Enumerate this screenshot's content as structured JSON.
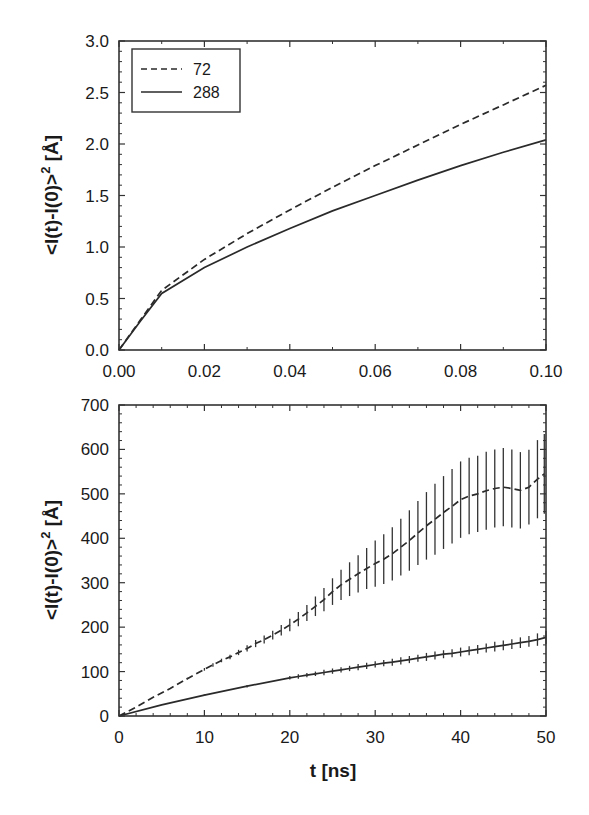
{
  "chart_data": [
    {
      "type": "line",
      "panel": "top",
      "title": "",
      "xlabel": "",
      "ylabel": "<l(t)-l(0)>² [Å]",
      "xlim": [
        0.0,
        0.1
      ],
      "ylim": [
        0.0,
        3.0
      ],
      "xticks": [
        "0.00",
        "0.02",
        "0.04",
        "0.06",
        "0.08",
        "0.10"
      ],
      "yticks": [
        "0.0",
        "0.5",
        "1.0",
        "1.5",
        "2.0",
        "2.5",
        "3.0"
      ],
      "grid": false,
      "legend_position": "upper-left",
      "series": [
        {
          "name": "72",
          "style": "dashed",
          "x": [
            0.0,
            0.005,
            0.01,
            0.02,
            0.03,
            0.04,
            0.05,
            0.06,
            0.07,
            0.08,
            0.09,
            0.1
          ],
          "y": [
            0.0,
            0.29,
            0.58,
            0.88,
            1.13,
            1.36,
            1.58,
            1.79,
            1.99,
            2.19,
            2.38,
            2.57
          ]
        },
        {
          "name": "288",
          "style": "solid",
          "x": [
            0.0,
            0.005,
            0.01,
            0.02,
            0.03,
            0.04,
            0.05,
            0.06,
            0.07,
            0.08,
            0.09,
            0.1
          ],
          "y": [
            0.0,
            0.28,
            0.55,
            0.8,
            1.0,
            1.18,
            1.35,
            1.5,
            1.65,
            1.79,
            1.92,
            2.04
          ]
        }
      ]
    },
    {
      "type": "line",
      "panel": "bottom",
      "title": "",
      "xlabel": "t [ns]",
      "ylabel": "<l(t)-l(0)>² [Å]",
      "xlim": [
        0,
        50
      ],
      "ylim": [
        0,
        700
      ],
      "xticks": [
        "0",
        "10",
        "20",
        "30",
        "40",
        "50"
      ],
      "yticks": [
        "0",
        "100",
        "200",
        "300",
        "400",
        "500",
        "600",
        "700"
      ],
      "grid": false,
      "series": [
        {
          "name": "72",
          "style": "dashed",
          "error_bars": true,
          "x": [
            0,
            2,
            4,
            6,
            8,
            10,
            11,
            12,
            13,
            14,
            15,
            16,
            17,
            18,
            19,
            20,
            21,
            22,
            23,
            24,
            25,
            26,
            27,
            28,
            29,
            30,
            31,
            32,
            33,
            34,
            35,
            36,
            37,
            38,
            39,
            40,
            41,
            42,
            43,
            44,
            45,
            46,
            47,
            48,
            49,
            49.8
          ],
          "y": [
            0,
            20,
            42,
            62,
            84,
            105,
            115,
            125,
            133,
            143,
            152,
            163,
            172,
            182,
            193,
            205,
            218,
            232,
            247,
            262,
            280,
            295,
            308,
            320,
            332,
            343,
            353,
            365,
            380,
            395,
            412,
            428,
            443,
            458,
            472,
            487,
            495,
            500,
            507,
            512,
            515,
            512,
            508,
            515,
            533,
            545
          ],
          "err": [
            0,
            0,
            0,
            0,
            2,
            3,
            4,
            4,
            5,
            6,
            7,
            8,
            9,
            10,
            12,
            14,
            16,
            18,
            22,
            26,
            30,
            34,
            38,
            42,
            46,
            52,
            56,
            60,
            64,
            68,
            72,
            76,
            80,
            82,
            84,
            86,
            86,
            86,
            88,
            88,
            88,
            88,
            86,
            84,
            88,
            90
          ]
        },
        {
          "name": "288",
          "style": "solid",
          "error_bars": true,
          "x": [
            0,
            5,
            10,
            15,
            20,
            21,
            22,
            23,
            24,
            25,
            26,
            27,
            28,
            29,
            30,
            31,
            32,
            33,
            34,
            35,
            36,
            37,
            38,
            39,
            40,
            41,
            42,
            43,
            44,
            45,
            46,
            47,
            48,
            49,
            50
          ],
          "y": [
            0,
            25,
            47,
            67,
            86,
            89,
            92,
            95,
            98,
            101,
            104,
            107,
            110,
            113,
            116,
            119,
            121,
            124,
            127,
            130,
            133,
            136,
            139,
            141,
            144,
            147,
            150,
            153,
            156,
            159,
            162,
            165,
            168,
            172,
            177
          ],
          "err": [
            0,
            0,
            2,
            3,
            4,
            5,
            5,
            5,
            6,
            6,
            6,
            6,
            7,
            7,
            7,
            7,
            8,
            8,
            8,
            8,
            9,
            9,
            9,
            9,
            10,
            10,
            10,
            10,
            11,
            11,
            11,
            12,
            12,
            14,
            15
          ]
        }
      ]
    }
  ],
  "legend": {
    "items": [
      {
        "label": "72",
        "style": "dashed"
      },
      {
        "label": "288",
        "style": "solid"
      }
    ]
  },
  "labels": {
    "top_ylabel": "<l(t)-l(0)>",
    "bottom_ylabel": "<l(t)-l(0)>",
    "ylabel_sup": "2",
    "ylabel_unit": "[Å]",
    "bottom_xlabel": "t [ns]"
  },
  "colors": {
    "line": "#2a2a2a",
    "frame": "#333333",
    "background": "#ffffff"
  }
}
